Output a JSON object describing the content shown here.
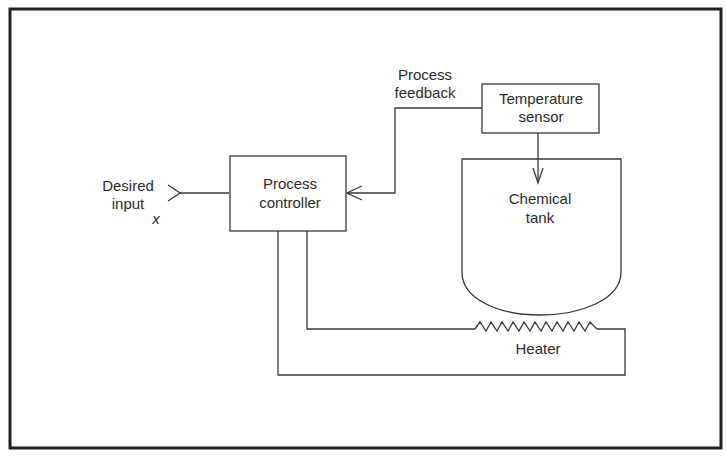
{
  "figure": {
    "type": "block-diagram"
  },
  "nodes": {
    "input": {
      "line1": "Desired",
      "line2": "input",
      "symbol": "x"
    },
    "controller": {
      "line1": "Process",
      "line2": "controller"
    },
    "sensor": {
      "line1": "Temperature",
      "line2": "sensor"
    },
    "tank": {
      "line1": "Chemical",
      "line2": "tank"
    },
    "heater": {
      "label": "Heater"
    }
  },
  "edges": {
    "feedback": {
      "line1": "Process",
      "line2": "feedback"
    }
  },
  "connections": [
    {
      "from": "input",
      "to": "controller"
    },
    {
      "from": "sensor",
      "to": "controller",
      "label": "Process feedback"
    },
    {
      "from": "sensor",
      "to": "tank"
    },
    {
      "from": "controller",
      "to": "heater"
    },
    {
      "from": "heater",
      "to": "controller"
    }
  ],
  "colors": {
    "line": "#3a3a3a",
    "frame": "#222222",
    "background": "#ffffff"
  }
}
